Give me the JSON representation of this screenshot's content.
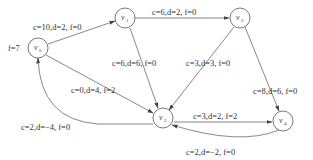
{
  "diagram": {
    "type": "network-flow-graph",
    "nodes": [
      {
        "id": "v0",
        "name": "v",
        "sub": "0",
        "x": 38,
        "y": 48
      },
      {
        "id": "v1",
        "name": "v",
        "sub": "1",
        "x": 125,
        "y": 18
      },
      {
        "id": "v3",
        "name": "v",
        "sub": "3",
        "x": 240,
        "y": 18
      },
      {
        "id": "v2",
        "name": "v",
        "sub": "2",
        "x": 163,
        "y": 118
      },
      {
        "id": "v4",
        "name": "v",
        "sub": "4",
        "x": 283,
        "y": 121
      }
    ],
    "source_label": "f=7",
    "edges": [
      {
        "from": "v0",
        "to": "v1",
        "label": "c=10,d=2, f=0"
      },
      {
        "from": "v1",
        "to": "v3",
        "label": "c=6,d=2, f=0"
      },
      {
        "from": "v1",
        "to": "v2",
        "label": "c=6,d=6, f=0"
      },
      {
        "from": "v0",
        "to": "v2",
        "label": "c=0,d=4, f=2"
      },
      {
        "from": "v3",
        "to": "v2",
        "label": "c=3,d=3, f=0"
      },
      {
        "from": "v3",
        "to": "v4",
        "label": "c=8,d=6, f=0"
      },
      {
        "from": "v2",
        "to": "v4",
        "label": "c=3,d=2, f=2"
      },
      {
        "from": "v4",
        "to": "v2",
        "label": "c=2,d=−2, f=0"
      },
      {
        "from": "v2",
        "to": "v0",
        "label": "c=2,d=−4, f=0"
      }
    ]
  }
}
